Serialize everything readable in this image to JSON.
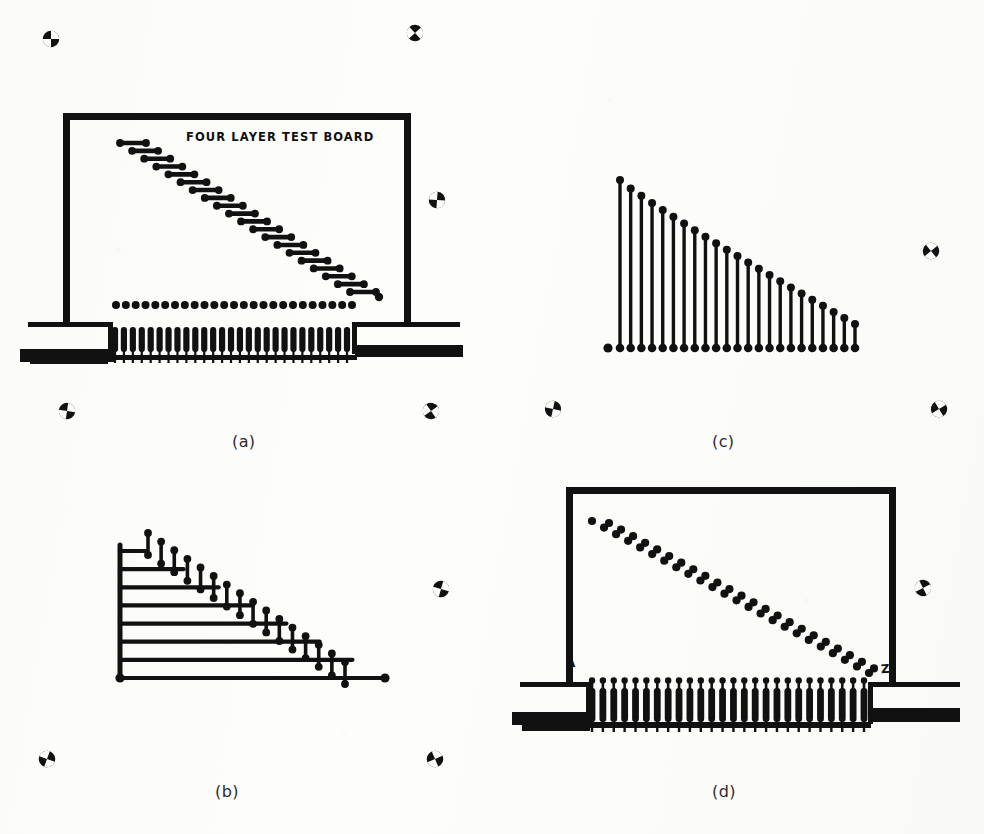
{
  "figure": {
    "title_text": "FOUR LAYER TEST BOARD",
    "panels": [
      {
        "id": "a",
        "label": "(a)",
        "label_x": 232,
        "label_y": 432,
        "description": "test board with card-edge connector, diagonal staircase of horizontal dumbbell traces and a row of round pads"
      },
      {
        "id": "b",
        "label": "(b)",
        "label_x": 215,
        "label_y": 782,
        "description": "horizontal trace ladder from vertical spine with stepped vertical dumbbell terminations"
      },
      {
        "id": "c",
        "label": "(c)",
        "label_x": 712,
        "label_y": 432,
        "description": "row of vertical lines of decreasing height, each ending in round pads"
      },
      {
        "id": "d",
        "label": "(d)",
        "label_x": 712,
        "label_y": 782,
        "description": "test board with connector pins and a double diagonal row of round pads"
      }
    ],
    "point_labels": [
      {
        "text": "A",
        "panel": "d",
        "x": 567,
        "y": 664
      },
      {
        "text": "Z",
        "panel": "d",
        "x": 883,
        "y": 668
      }
    ]
  },
  "chart_data": {
    "type": "diagram",
    "title": "FOUR LAYER TEST BOARD",
    "panel_a": {
      "board_rect": {
        "x": 63,
        "y": 113,
        "w": 348,
        "h": 205
      },
      "diagonal_dumbbells": 20,
      "dumbbell_start": {
        "x": 120,
        "y": 143
      },
      "dumbbell_end": {
        "x": 350,
        "y": 292
      },
      "pad_row_count": 25,
      "pad_row_y": 305,
      "pad_row_x_start": 116,
      "pad_row_x_end": 352,
      "stray_pad": {
        "x": 379,
        "y": 297
      },
      "connector_pins": 27,
      "connector_x_start": 110,
      "connector_x_end": 352,
      "connector_top_y": 327,
      "connector_bottom_y": 356
    },
    "panel_b": {
      "spine": {
        "x": 120,
        "y_top": 545,
        "y_bottom": 678
      },
      "horizontal_traces": 8,
      "trace_x_start": 120,
      "trace_longest_x_end": 385,
      "trace_y_top": 551,
      "trace_y_bottom": 678,
      "vertical_dumbbells": 16,
      "dumbbell_x_start": 148,
      "dumbbell_x_end": 345
    },
    "panel_c": {
      "baseline_y": 348,
      "x_start": 608,
      "x_end": 855,
      "bars": 23,
      "tallest_height": 168,
      "shortest_height": 24,
      "origin_pad": {
        "x": 608,
        "y": 348
      }
    },
    "panel_d": {
      "board_rect": {
        "x": 566,
        "y": 487,
        "w": 330,
        "h": 195
      },
      "diagonal_pad_rows": 2,
      "pads_per_row": 24,
      "pad_start": {
        "x": 600,
        "y": 521
      },
      "pad_end": {
        "x": 877,
        "y": 673
      },
      "connector_pins": 26,
      "connector_x_start": 588,
      "connector_x_end": 868,
      "connector_top_y": 679,
      "connector_bottom_y": 732
    },
    "registration_marks": [
      {
        "x": 40,
        "y": 28
      },
      {
        "x": 404,
        "y": 22
      },
      {
        "x": 426,
        "y": 189
      },
      {
        "x": 920,
        "y": 240
      },
      {
        "x": 56,
        "y": 400
      },
      {
        "x": 420,
        "y": 400
      },
      {
        "x": 542,
        "y": 398
      },
      {
        "x": 928,
        "y": 398
      },
      {
        "x": 430,
        "y": 578
      },
      {
        "x": 912,
        "y": 577
      },
      {
        "x": 36,
        "y": 748
      },
      {
        "x": 424,
        "y": 748
      }
    ],
    "colors": {
      "ink": "#111111",
      "paper": "#fdfdfb"
    }
  }
}
